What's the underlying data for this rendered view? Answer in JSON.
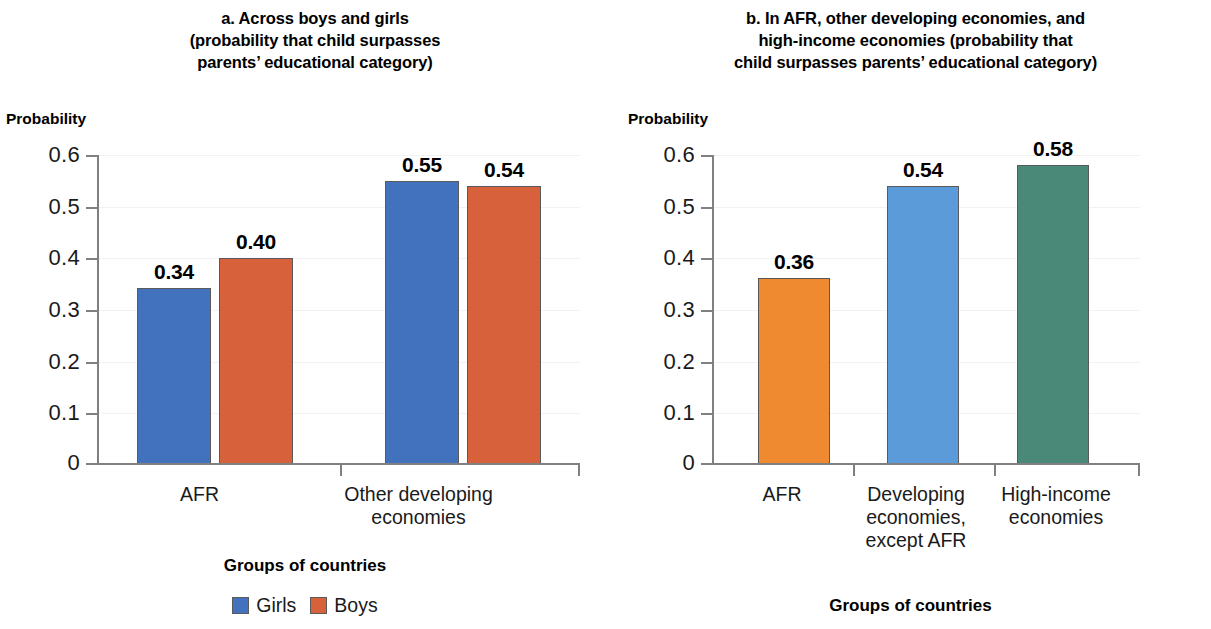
{
  "panel_a": {
    "title_lines": [
      "a. Across boys and girls",
      "(probability that child surpasses",
      "parents’ educational category)"
    ],
    "y_caption": "Probability",
    "x_caption": "Groups of countries",
    "y_ticks": [
      "0.6",
      "0.5",
      "0.4",
      "0.3",
      "0.2",
      "0.1",
      "0"
    ],
    "categories": [
      {
        "lines": [
          "AFR"
        ]
      },
      {
        "lines": [
          "Other developing",
          "economies"
        ]
      }
    ],
    "legend": [
      {
        "label": "Girls",
        "color": "#4272BD"
      },
      {
        "label": "Boys",
        "color": "#D6613A"
      }
    ],
    "bars": [
      {
        "group": 0,
        "series": "Girls",
        "value": 0.34,
        "label": "0.34",
        "color": "#4272BD"
      },
      {
        "group": 0,
        "series": "Boys",
        "value": 0.4,
        "label": "0.40",
        "color": "#D6613A"
      },
      {
        "group": 1,
        "series": "Girls",
        "value": 0.55,
        "label": "0.55",
        "color": "#4272BD"
      },
      {
        "group": 1,
        "series": "Boys",
        "value": 0.54,
        "label": "0.54",
        "color": "#D6613A"
      }
    ]
  },
  "panel_b": {
    "title_lines": [
      "b. In AFR, other developing economies, and",
      "high-income economies (probability that",
      "child surpasses parents’ educational category)"
    ],
    "y_caption": "Probability",
    "x_caption": "Groups of countries",
    "y_ticks": [
      "0.6",
      "0.5",
      "0.4",
      "0.3",
      "0.2",
      "0.1",
      "0"
    ],
    "categories": [
      {
        "lines": [
          "AFR"
        ]
      },
      {
        "lines": [
          "Developing",
          "economies,",
          "except AFR"
        ]
      },
      {
        "lines": [
          "High-income",
          "economies"
        ]
      }
    ],
    "bars": [
      {
        "value": 0.36,
        "label": "0.36",
        "color": "#F08A30"
      },
      {
        "value": 0.54,
        "label": "0.54",
        "color": "#5B9BD9"
      },
      {
        "value": 0.58,
        "label": "0.58",
        "color": "#4A8878"
      }
    ]
  },
  "chart_data": [
    {
      "type": "bar",
      "panel": "a",
      "title": "a. Across boys and girls (probability that child surpasses parents’ educational category)",
      "xlabel": "Groups of countries",
      "ylabel": "Probability",
      "categories": [
        "AFR",
        "Other developing economies"
      ],
      "series": [
        {
          "name": "Girls",
          "values": [
            0.34,
            0.55
          ],
          "color": "#4272BD"
        },
        {
          "name": "Boys",
          "values": [
            0.4,
            0.54
          ],
          "color": "#D6613A"
        }
      ],
      "ylim": [
        0,
        0.6
      ],
      "yticks": [
        0,
        0.1,
        0.2,
        0.3,
        0.4,
        0.5,
        0.6
      ],
      "grid": "faint-horizontal",
      "legend_position": "bottom-center",
      "data_labels": [
        "0.34",
        "0.40",
        "0.55",
        "0.54"
      ]
    },
    {
      "type": "bar",
      "panel": "b",
      "title": "b. In AFR, other developing economies, and high-income economies (probability that child surpasses parents’ educational category)",
      "xlabel": "Groups of countries",
      "ylabel": "Probability",
      "categories": [
        "AFR",
        "Developing economies, except AFR",
        "High-income economies"
      ],
      "values": [
        0.36,
        0.54,
        0.58
      ],
      "colors": [
        "#F08A30",
        "#5B9BD9",
        "#4A8878"
      ],
      "ylim": [
        0,
        0.6
      ],
      "yticks": [
        0,
        0.1,
        0.2,
        0.3,
        0.4,
        0.5,
        0.6
      ],
      "grid": "faint-horizontal",
      "legend_position": "none",
      "data_labels": [
        "0.36",
        "0.54",
        "0.58"
      ]
    }
  ]
}
